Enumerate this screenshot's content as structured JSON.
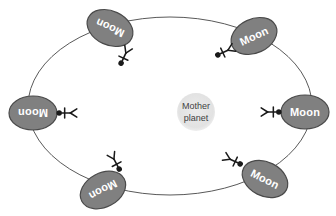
{
  "diagram": {
    "background_color": "#ffffff",
    "orbit": {
      "name": "orbit-ellipse",
      "center_x": 170,
      "center_y": 106,
      "radius_x": 142,
      "radius_y": 89,
      "stroke_color": "#595959",
      "stroke_width": 1,
      "fill": "none"
    },
    "planet": {
      "label_line1": "Mother",
      "label_line2": "planet",
      "center_x": 196,
      "center_y": 112,
      "radius": 19,
      "fill_color": "#e2e2e2",
      "text_color": "#3f3f3f"
    },
    "moon_style": {
      "fill_color": "#808080",
      "stroke_color": "#4a4a4a",
      "text_color": "#ffffff",
      "radius_x": 24,
      "radius_y": 17
    },
    "figure_style": {
      "color": "#1a1a1a",
      "stroke_width": 1.6
    },
    "moons": [
      {
        "id": "moon-top-left",
        "label": "Moon",
        "center_x": 110,
        "center_y": 28,
        "rotation": 205,
        "figure_x": 124,
        "figure_y": 57,
        "figure_rotation": 205
      },
      {
        "id": "moon-top-right",
        "label": "Moon",
        "center_x": 254,
        "center_y": 36,
        "rotation": 335,
        "figure_x": 224,
        "figure_y": 52,
        "figure_rotation": 245
      },
      {
        "id": "moon-left",
        "label": "Moon",
        "center_x": 33,
        "center_y": 113,
        "rotation": 180,
        "figure_x": 66,
        "figure_y": 113,
        "figure_rotation": 270
      },
      {
        "id": "moon-right",
        "label": "Moon",
        "center_x": 305,
        "center_y": 112,
        "rotation": 0,
        "figure_x": 272,
        "figure_y": 112,
        "figure_rotation": 90
      },
      {
        "id": "moon-bottom-left",
        "label": "Moon",
        "center_x": 103,
        "center_y": 190,
        "rotation": 152,
        "figure_x": 116,
        "figure_y": 163,
        "figure_rotation": 152
      },
      {
        "id": "moon-bottom-right",
        "label": "Moon",
        "center_x": 265,
        "center_y": 179,
        "rotation": 27,
        "figure_x": 234,
        "figure_y": 161,
        "figure_rotation": 115
      }
    ]
  }
}
